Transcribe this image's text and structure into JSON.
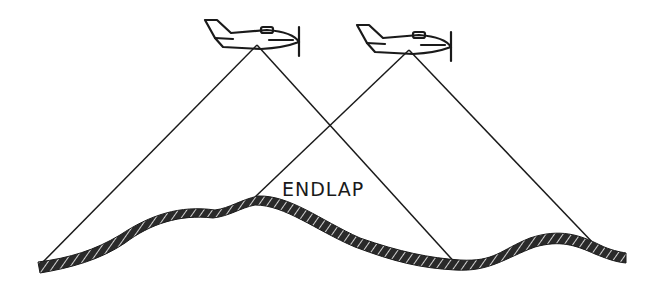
{
  "diagram": {
    "label": "ENDLAP",
    "colors": {
      "ink": "#1a1a1a",
      "background": "#ffffff"
    },
    "aircraft": [
      {
        "name": "airplane-1",
        "x": 257,
        "y": 45
      },
      {
        "name": "airplane-2",
        "x": 409,
        "y": 50
      }
    ]
  }
}
